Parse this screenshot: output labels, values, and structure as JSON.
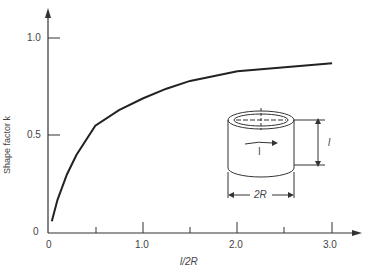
{
  "chart_data": {
    "type": "line",
    "title": "",
    "xlabel": "l/2R",
    "ylabel": "Shape factor k",
    "xlim": [
      0,
      3.2
    ],
    "ylim": [
      0,
      1.1
    ],
    "x_ticks": [
      "0",
      "1.0",
      "2.0",
      "3.0"
    ],
    "y_ticks": [
      "0",
      "0.5",
      "1.0"
    ],
    "grid": false,
    "series": [
      {
        "name": "k",
        "x": [
          0.04,
          0.1,
          0.2,
          0.3,
          0.5,
          0.75,
          1.0,
          1.25,
          1.5,
          2.0,
          2.5,
          3.0
        ],
        "values": [
          0.06,
          0.17,
          0.3,
          0.4,
          0.55,
          0.63,
          0.69,
          0.74,
          0.78,
          0.83,
          0.85,
          0.87
        ]
      }
    ],
    "annotations": [
      "cylinder diagram with dimensions l and 2R, arrow I"
    ]
  },
  "labels": {
    "ylabel": "Shape factor k",
    "xlabel": "l/2R",
    "y0": "0",
    "y05": "0.5",
    "y10": "1.0",
    "x0": "0",
    "x1": "1.0",
    "x2": "2.0",
    "x3": "3.0",
    "dim_l": "l",
    "dim_2r": "2R",
    "current": "I"
  }
}
